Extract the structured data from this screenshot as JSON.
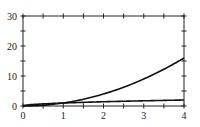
{
  "chart_data": {
    "type": "line",
    "title": "",
    "xlabel": "",
    "ylabel": "",
    "xlim": [
      0,
      4
    ],
    "ylim": [
      0,
      30
    ],
    "grid": false,
    "legend": null,
    "x_ticks": [
      "0",
      "1",
      "2",
      "3",
      "4"
    ],
    "y_ticks": [
      "0",
      "10",
      "20",
      "30"
    ],
    "x": [
      0,
      0.5,
      1,
      1.5,
      2,
      2.5,
      3,
      3.5,
      4
    ],
    "series": [
      {
        "name": "x^2",
        "values": [
          0,
          0.25,
          1,
          2.25,
          4,
          6.25,
          9,
          12.25,
          16
        ]
      },
      {
        "name": "sqrt(x)",
        "values": [
          0,
          0.71,
          1,
          1.22,
          1.41,
          1.58,
          1.73,
          1.87,
          2
        ]
      }
    ],
    "colors": {
      "line": "#111111",
      "axis": "#222222"
    }
  }
}
